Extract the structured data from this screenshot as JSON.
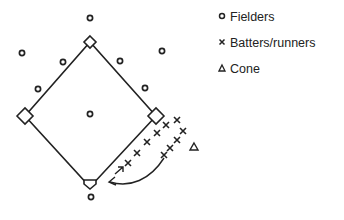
{
  "diagram": {
    "type": "baseball-field-drill",
    "bases": {
      "second": [
        90,
        42
      ],
      "third": [
        25,
        116
      ],
      "first": [
        156,
        116
      ],
      "home": [
        90,
        187
      ]
    },
    "fielders": [
      [
        90,
        18
      ],
      [
        22,
        53
      ],
      [
        63,
        62
      ],
      [
        120,
        61
      ],
      [
        162,
        51
      ],
      [
        38,
        89
      ],
      [
        145,
        88
      ],
      [
        90,
        114
      ],
      [
        91,
        197
      ]
    ],
    "batters_runners": [
      [
        166,
        125
      ],
      [
        177,
        120
      ],
      [
        183,
        131
      ],
      [
        157,
        133
      ],
      [
        177,
        140
      ],
      [
        147,
        142
      ],
      [
        170,
        148
      ],
      [
        137,
        153
      ],
      [
        164,
        155
      ],
      [
        128,
        163
      ]
    ],
    "cone": [
      194,
      147
    ],
    "arrows": [
      {
        "from": [
          115,
          174
        ],
        "to": [
          122,
          168
        ],
        "type": "straight"
      },
      {
        "from": [
          164,
          158
        ],
        "to": [
          110,
          183
        ],
        "type": "curved"
      }
    ]
  },
  "legend": {
    "items": [
      {
        "symbol": "circle",
        "label": "Fielders"
      },
      {
        "symbol": "x",
        "label": "Batters/runners"
      },
      {
        "symbol": "triangle",
        "label": "Cone"
      }
    ]
  }
}
